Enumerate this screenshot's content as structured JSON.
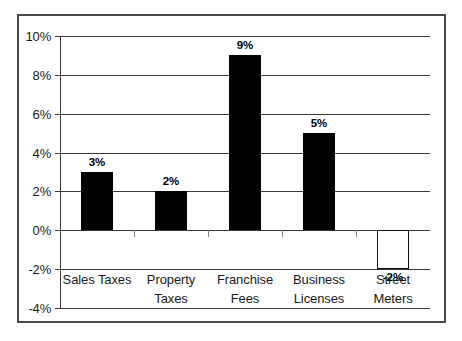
{
  "chart_data": {
    "type": "bar",
    "title": "",
    "subtitle": "",
    "xlabel": "",
    "ylabel": "",
    "categories": [
      "Sales Taxes",
      "Property Taxes",
      "Franchise Fees",
      "Business Licenses",
      "Street Meters"
    ],
    "category_lines": [
      [
        "Sales Taxes"
      ],
      [
        "Property",
        "Taxes"
      ],
      [
        "Franchise",
        "Fees"
      ],
      [
        "Business",
        "Licenses"
      ],
      [
        "Street Meters"
      ]
    ],
    "values": [
      3,
      2,
      9,
      5,
      -2
    ],
    "data_labels": [
      "3%",
      "2%",
      "9%",
      "5%",
      "-2%"
    ],
    "ylim": [
      -4,
      10
    ],
    "ytick_values": [
      10,
      8,
      6,
      4,
      2,
      0,
      -2,
      -4
    ],
    "ytick_labels": [
      "10%",
      "8%",
      "6%",
      "4%",
      "2%",
      "0%",
      "-2%",
      "-4%"
    ],
    "grid": true,
    "legend": false,
    "legend_position": "none",
    "bar_fill_positive": "#000000",
    "bar_fill_negative": "#ffffff",
    "bar_stroke_negative": "#111111",
    "axis_color": "#3a3a3a",
    "frame_color": "#4a4a4a",
    "background": "#ffffff"
  }
}
